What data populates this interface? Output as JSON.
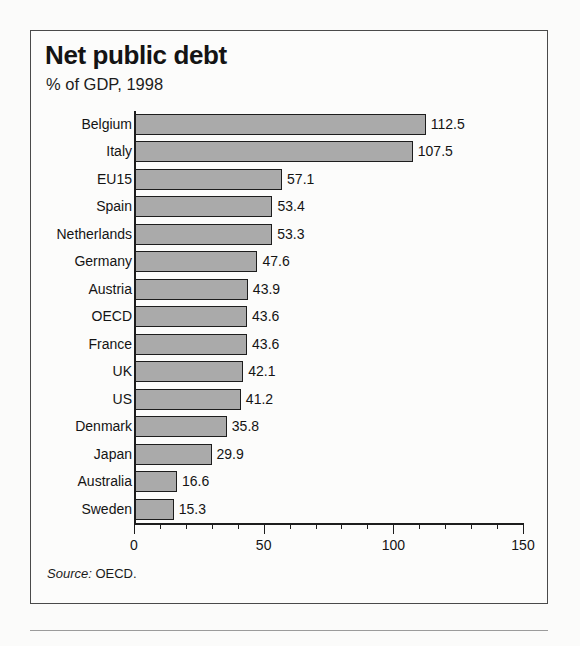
{
  "chart_data": {
    "type": "bar",
    "orientation": "horizontal",
    "title": "Net public debt",
    "subtitle": "% of GDP, 1998",
    "xlabel": "",
    "ylabel": "",
    "xlim": [
      0,
      150
    ],
    "xticks": [
      0,
      50,
      100,
      150
    ],
    "xtick_labels": [
      "0",
      "50",
      "100",
      "150"
    ],
    "minor_tick_step": 10,
    "grid": false,
    "legend": null,
    "source_note": "Source: OECD.",
    "source_prefix": "Source:",
    "source_value": "OECD.",
    "bar_fill_color": "#aaaaaa",
    "bar_border_color": "#1d1d1d",
    "background_color": "#fcfcfb",
    "categories": [
      "Belgium",
      "Italy",
      "EU15",
      "Spain",
      "Netherlands",
      "Germany",
      "Austria",
      "OECD",
      "France",
      "UK",
      "US",
      "Denmark",
      "Japan",
      "Australia",
      "Sweden"
    ],
    "values": [
      112.5,
      107.5,
      57.1,
      53.4,
      53.3,
      47.6,
      43.9,
      43.6,
      43.6,
      42.1,
      41.2,
      35.8,
      29.9,
      16.6,
      15.3
    ],
    "value_labels": [
      "112.5",
      "107.5",
      "57.1",
      "53.4",
      "53.3",
      "47.6",
      "43.9",
      "43.6",
      "43.6",
      "42.1",
      "41.2",
      "35.8",
      "29.9",
      "16.6",
      "15.3"
    ]
  }
}
